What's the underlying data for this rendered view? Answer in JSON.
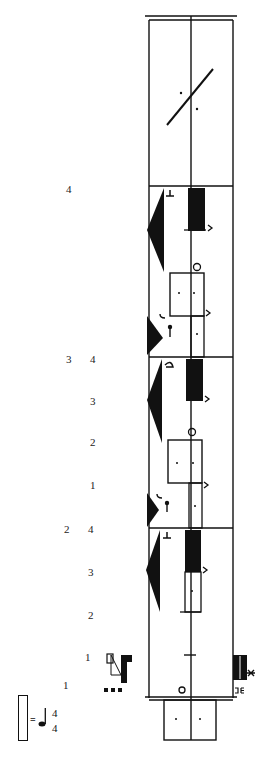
{
  "score": {
    "type": "labanotation-staff",
    "time_signature": {
      "top": "4",
      "bottom": "4",
      "note": "quarter-note"
    },
    "staff": {
      "left": 149,
      "center": 191,
      "right": 233,
      "top": 18,
      "bottom": 698
    },
    "bar_lines_y": [
      186,
      357,
      528
    ],
    "measure_numbers": [
      {
        "label": "4",
        "x": 66,
        "y": 188
      },
      {
        "label": "3",
        "x": 66,
        "y": 358
      },
      {
        "label": "2",
        "x": 64,
        "y": 528
      }
    ],
    "beat_numbers": [
      {
        "label": "4",
        "x": 90,
        "y": 358
      },
      {
        "label": "3",
        "x": 90,
        "y": 400
      },
      {
        "label": "2",
        "x": 90,
        "y": 441
      },
      {
        "label": "1",
        "x": 90,
        "y": 484
      },
      {
        "label": "4",
        "x": 88,
        "y": 528
      },
      {
        "label": "3",
        "x": 88,
        "y": 571
      },
      {
        "label": "2",
        "x": 88,
        "y": 614
      },
      {
        "label": "1",
        "x": 85,
        "y": 656
      },
      {
        "label": "1",
        "x": 63,
        "y": 684
      }
    ],
    "legend": {
      "eq": "=",
      "top": "4",
      "bottom": "4"
    }
  }
}
